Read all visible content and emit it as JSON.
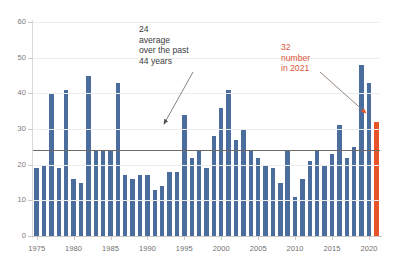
{
  "chart_data": {
    "type": "bar",
    "title": "",
    "subtitle": "",
    "xlabel": "",
    "ylabel": "",
    "ylim": [
      0,
      60
    ],
    "ytick_values": [
      0,
      10,
      20,
      30,
      40,
      50,
      60
    ],
    "ytick_labels": [
      "0",
      "10",
      "20",
      "30",
      "40",
      "50",
      "60"
    ],
    "xtick_labels": [
      "1975",
      "1980",
      "1985",
      "1990",
      "1995",
      "2000",
      "2005",
      "2010",
      "2015",
      "2020"
    ],
    "grid": true,
    "legend": "none",
    "bar_color": "#4a6d9e",
    "highlight_color": "#e8542a",
    "highlight_category": "2021",
    "average_value": 24,
    "average_line_color": "#6e6a62",
    "categories": [
      "1975",
      "1976",
      "1977",
      "1978",
      "1979",
      "1980",
      "1981",
      "1982",
      "1983",
      "1984",
      "1985",
      "1986",
      "1987",
      "1988",
      "1989",
      "1990",
      "1991",
      "1992",
      "1993",
      "1994",
      "1995",
      "1996",
      "1997",
      "1998",
      "1999",
      "2000",
      "2001",
      "2002",
      "2003",
      "2004",
      "2005",
      "2006",
      "2007",
      "2008",
      "2009",
      "2010",
      "2011",
      "2012",
      "2013",
      "2014",
      "2015",
      "2016",
      "2017",
      "2018",
      "2019",
      "2020",
      "2021"
    ],
    "values": [
      19,
      20,
      40,
      19,
      41,
      16,
      15,
      45,
      24,
      24,
      24,
      43,
      17,
      16,
      17,
      17,
      13,
      14,
      18,
      18,
      34,
      22,
      24,
      19,
      28,
      36,
      41,
      27,
      30,
      24,
      22,
      20,
      19,
      15,
      24,
      11,
      16,
      21,
      24,
      20,
      23,
      31,
      22,
      25,
      48,
      43,
      32
    ]
  },
  "annotations": {
    "average": {
      "text": "24\naverage\nover the past\n44 years",
      "color": "#3c3c3c",
      "value": "24"
    },
    "highlight": {
      "text": "32\nnumber\nin 2021",
      "color": "#d9563a",
      "value": "32"
    }
  }
}
